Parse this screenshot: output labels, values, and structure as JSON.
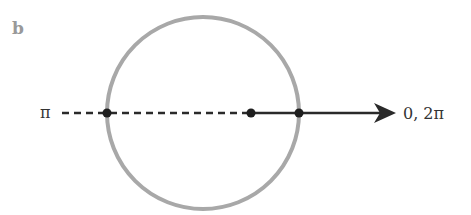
{
  "panel_label": "b",
  "labels": {
    "left": "π",
    "right": "0, 2π"
  },
  "colors": {
    "circle": "#a8a8a8",
    "line": "#2a2a2a",
    "point": "#1e1e1e",
    "panel_label": "#999999"
  },
  "elements": {
    "circle": "unit-circle",
    "ray": "solid-arrow-toward-0-2pi",
    "dashed": "dashed-line-toward-pi",
    "points": [
      "left-intersection",
      "center-offset-point",
      "right-intersection"
    ]
  }
}
